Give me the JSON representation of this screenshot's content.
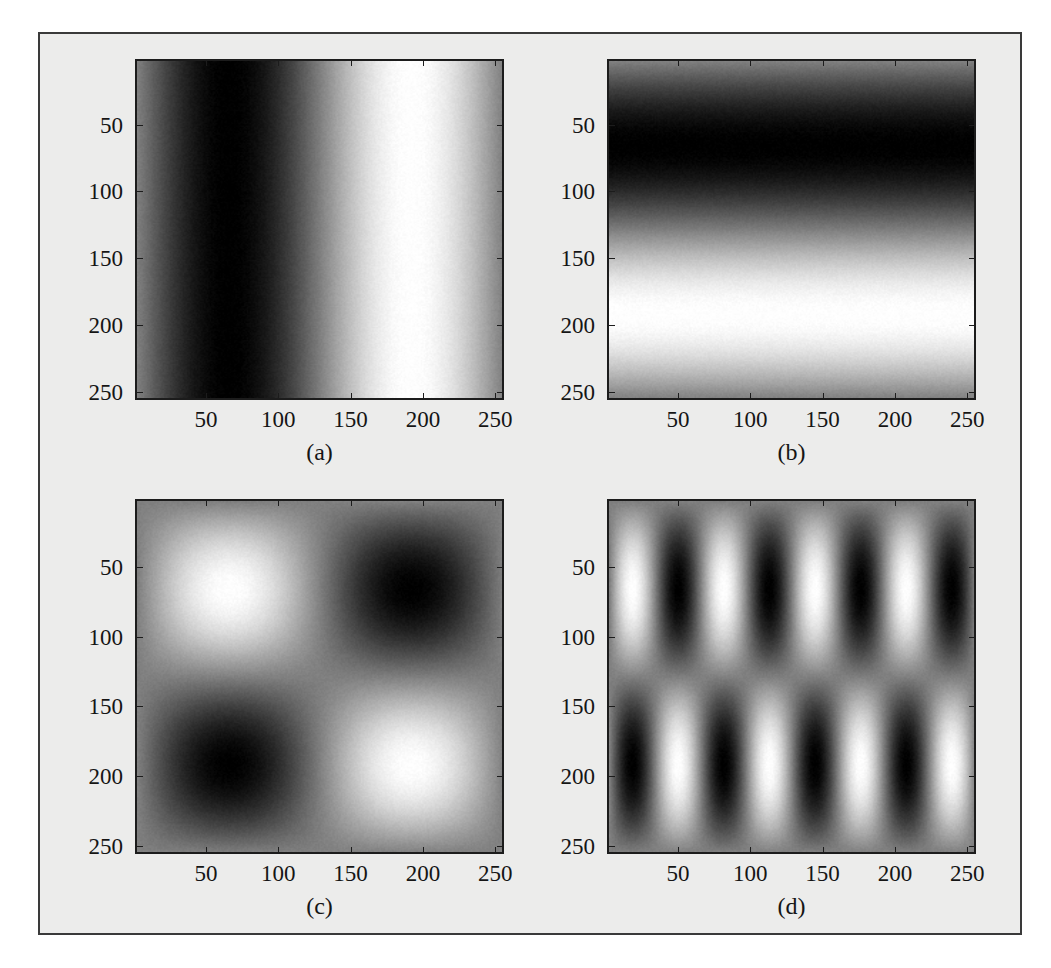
{
  "figure": {
    "background_color": "#ececeb",
    "frame_border_color": "#3a3a3a",
    "page_background": "#ffffff",
    "axis_color": "#1c1c1c",
    "text_color": "#151515"
  },
  "axes": {
    "x_ticks": [
      "50",
      "100",
      "150",
      "200",
      "250"
    ],
    "y_ticks": [
      "50",
      "100",
      "150",
      "200",
      "250"
    ],
    "x_tick_values": [
      50,
      100,
      150,
      200,
      250
    ],
    "y_tick_values": [
      50,
      100,
      150,
      200,
      250
    ],
    "x_range": [
      1,
      256
    ],
    "y_range": [
      1,
      256
    ]
  },
  "chart_data": {
    "type": "heatmap",
    "title": "",
    "xlabel": "",
    "ylabel": "",
    "colormap": "gray",
    "grid": false,
    "legend": "none",
    "image_size": [
      256,
      256
    ],
    "panels": [
      {
        "caption": "(a)",
        "name": "panel-a-vertical-sinusoid",
        "description": "Vertical bars: one cycle horizontally, constant vertically",
        "u_cycles": 1.0,
        "v_cycles": 0.0,
        "phase_deg": 90,
        "amplitude": 1.0,
        "offset": 0.0,
        "bright_peak_x": 65,
        "dark_trough_x": 195,
        "xlim": [
          1,
          256
        ],
        "ylim": [
          1,
          256
        ],
        "value_range": [
          -1,
          1
        ]
      },
      {
        "caption": "(b)",
        "name": "panel-b-horizontal-sinusoid",
        "description": "Horizontal bars: one cycle vertically, constant horizontally",
        "u_cycles": 0.0,
        "v_cycles": 1.0,
        "phase_deg": 90,
        "amplitude": 1.0,
        "offset": 0.0,
        "bright_peak_y": 70,
        "dark_trough_y": 198,
        "xlim": [
          1,
          256
        ],
        "ylim": [
          1,
          256
        ],
        "value_range": [
          -1,
          1
        ]
      },
      {
        "caption": "(c)",
        "name": "panel-c-checkerboard-sinusoid",
        "description": "Separable product: one cycle horizontally by one cycle vertically",
        "u_cycles": 1.0,
        "v_cycles": 1.0,
        "phase_deg": 90,
        "amplitude": 1.0,
        "offset": 0.0,
        "bright_blobs": [
          [
            65,
            75
          ],
          [
            195,
            200
          ]
        ],
        "dark_blobs": [
          [
            195,
            75
          ],
          [
            65,
            200
          ]
        ],
        "xlim": [
          1,
          256
        ],
        "ylim": [
          1,
          256
        ],
        "value_range": [
          -1,
          1
        ]
      },
      {
        "caption": "(d)",
        "name": "panel-d-high-frequency-checkerboard",
        "description": "Separable product: four cycles horizontally by one cycle vertically",
        "u_cycles": 4.0,
        "v_cycles": 1.0,
        "phase_deg": 90,
        "amplitude": 1.0,
        "offset": 0.0,
        "xlim": [
          1,
          256
        ],
        "ylim": [
          1,
          256
        ],
        "value_range": [
          -1,
          1
        ]
      }
    ]
  }
}
